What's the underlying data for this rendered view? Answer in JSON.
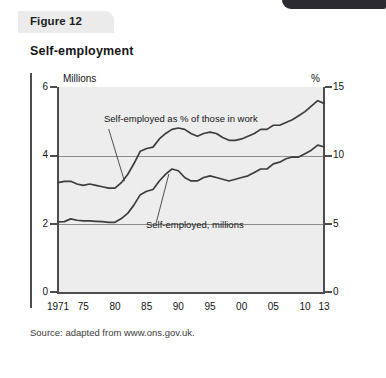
{
  "figure": {
    "tab_label": "Figure 12",
    "title": "Self-employment",
    "source": "Source: adapted from www.ons.gov.uk."
  },
  "chart_data": {
    "type": "line",
    "title": "Self-employment",
    "xlabel": "",
    "ylabel": "Millions",
    "ylabel_right": "%",
    "ylim": [
      0,
      6
    ],
    "ylim_right": [
      0,
      15
    ],
    "yticks": [
      "0",
      "2",
      "4",
      "6"
    ],
    "yticks_right": [
      "0",
      "5",
      "10",
      "15"
    ],
    "grid": true,
    "legend_position": "inline-annotation",
    "x": [
      1971,
      1972,
      1973,
      1974,
      1975,
      1976,
      1977,
      1978,
      1979,
      1980,
      1981,
      1982,
      1983,
      1984,
      1985,
      1986,
      1987,
      1988,
      1989,
      1990,
      1991,
      1992,
      1993,
      1994,
      1995,
      1996,
      1997,
      1998,
      1999,
      2000,
      2001,
      2002,
      2003,
      2004,
      2005,
      2006,
      2007,
      2008,
      2009,
      2010,
      2011,
      2012,
      2013
    ],
    "xtick_labels": [
      "1971",
      "75",
      "80",
      "85",
      "90",
      "95",
      "00",
      "05",
      "10",
      "13"
    ],
    "xtick_values": [
      1971,
      1975,
      1980,
      1985,
      1990,
      1995,
      2000,
      2005,
      2010,
      2013
    ],
    "series": [
      {
        "name": "Self-employed as % of those in work",
        "axis": "right",
        "unit": "%",
        "values": [
          8.0,
          8.1,
          8.1,
          7.9,
          7.8,
          7.9,
          7.8,
          7.7,
          7.6,
          7.6,
          8.0,
          8.6,
          9.4,
          10.3,
          10.5,
          10.6,
          11.2,
          11.6,
          11.9,
          12.0,
          11.9,
          11.6,
          11.4,
          11.6,
          11.7,
          11.6,
          11.3,
          11.1,
          11.1,
          11.2,
          11.4,
          11.6,
          11.9,
          11.9,
          12.2,
          12.2,
          12.4,
          12.6,
          12.9,
          13.2,
          13.6,
          14.0,
          13.8
        ]
      },
      {
        "name": "Self-employed, millions",
        "axis": "left",
        "unit": "millions",
        "values": [
          2.05,
          2.06,
          2.14,
          2.1,
          2.08,
          2.08,
          2.07,
          2.06,
          2.04,
          2.04,
          2.15,
          2.3,
          2.55,
          2.85,
          2.95,
          3.0,
          3.25,
          3.45,
          3.6,
          3.55,
          3.35,
          3.25,
          3.25,
          3.35,
          3.4,
          3.35,
          3.3,
          3.25,
          3.3,
          3.35,
          3.4,
          3.5,
          3.6,
          3.6,
          3.75,
          3.8,
          3.9,
          3.95,
          3.95,
          4.05,
          4.15,
          4.3,
          4.25
        ]
      }
    ],
    "annotations": [
      {
        "text": "Self-employed as % of those in work",
        "target_series": "Self-employed as % of those in work"
      },
      {
        "text": "Self-employed, millions",
        "target_series": "Self-employed, millions"
      }
    ],
    "colors": {
      "line": "#3d3d3d",
      "plot_background": "#ededed",
      "axis": "#4d4d4d",
      "grid": "#8c8c8c",
      "accent_band": "#2b2b2f",
      "tab_background": "#ebebeb"
    }
  }
}
